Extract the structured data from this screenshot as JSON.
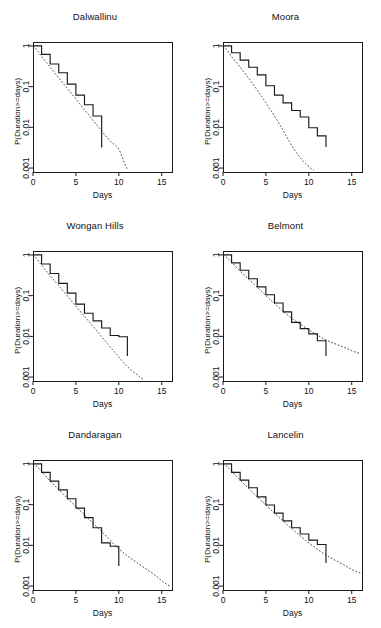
{
  "figure": {
    "layout": {
      "rows": 3,
      "cols": 2
    },
    "common_xlabel": "Days",
    "common_ylabel": "P(Duration>=days)",
    "x_ticks": [
      0,
      5,
      10,
      15
    ],
    "x_tick_labels": [
      "0",
      "5",
      "10",
      "15"
    ],
    "y_ticks": [
      1,
      0.1,
      0.01,
      0.001
    ],
    "y_tick_labels": [
      "1",
      "0.1",
      "0.01",
      "0.001"
    ],
    "y_scale": "log",
    "xlim": [
      0,
      16.2
    ],
    "ylim": [
      0.0008,
      1.25
    ],
    "line_color": "#1a1a1a",
    "fit_style": "dashed",
    "step_style": "solid"
  },
  "chart_data": [
    {
      "type": "line",
      "title": "Dalwallinu",
      "xlabel": "Days",
      "ylabel": "P(Duration>=days)",
      "yscale": "log",
      "xlim": [
        0,
        16.2
      ],
      "ylim": [
        0.0008,
        1.25
      ],
      "xticks": [
        0,
        5,
        10,
        15
      ],
      "yticks": [
        1,
        0.1,
        0.01,
        0.001
      ],
      "grid": false,
      "legend": "none",
      "series": [
        {
          "name": "empirical step",
          "style": "solid-step",
          "x": [
            0,
            1,
            2,
            3,
            4,
            5,
            6,
            7,
            8,
            8
          ],
          "y": [
            1.0,
            0.62,
            0.36,
            0.22,
            0.115,
            0.062,
            0.036,
            0.019,
            0.0105,
            0.0032
          ]
        },
        {
          "name": "fitted",
          "style": "dashed",
          "x": [
            0,
            1,
            2,
            3,
            4,
            5,
            6,
            7,
            8,
            9,
            10,
            11
          ],
          "y": [
            1.0,
            0.55,
            0.3,
            0.165,
            0.09,
            0.05,
            0.027,
            0.015,
            0.0082,
            0.0046,
            0.0029,
            0.00095
          ]
        }
      ]
    },
    {
      "type": "line",
      "title": "Moora",
      "xlabel": "Days",
      "ylabel": "P(Duration>=days)",
      "yscale": "log",
      "xlim": [
        0,
        16.2
      ],
      "ylim": [
        0.0008,
        1.25
      ],
      "xticks": [
        0,
        5,
        10,
        15
      ],
      "yticks": [
        1,
        0.1,
        0.01,
        0.001
      ],
      "grid": false,
      "legend": "none",
      "series": [
        {
          "name": "empirical step",
          "style": "solid-step",
          "x": [
            0,
            1,
            2,
            3,
            4,
            5,
            6,
            7,
            8,
            9,
            10,
            11,
            12,
            12
          ],
          "y": [
            1.0,
            0.68,
            0.45,
            0.3,
            0.195,
            0.105,
            0.062,
            0.04,
            0.026,
            0.018,
            0.0098,
            0.0062,
            0.0062,
            0.0033
          ]
        },
        {
          "name": "fitted",
          "style": "dashed",
          "x": [
            0,
            1,
            2,
            3,
            4,
            5,
            6,
            7,
            8,
            9,
            10,
            10.6
          ],
          "y": [
            1.0,
            0.55,
            0.3,
            0.16,
            0.082,
            0.04,
            0.019,
            0.0085,
            0.0036,
            0.0018,
            0.0011,
            0.0009
          ]
        }
      ]
    },
    {
      "type": "line",
      "title": "Wongan Hills",
      "xlabel": "Days",
      "ylabel": "P(Duration>=days)",
      "yscale": "log",
      "xlim": [
        0,
        16.2
      ],
      "ylim": [
        0.0008,
        1.25
      ],
      "xticks": [
        0,
        5,
        10,
        15
      ],
      "yticks": [
        1,
        0.1,
        0.01,
        0.001
      ],
      "grid": false,
      "legend": "none",
      "series": [
        {
          "name": "empirical step",
          "style": "solid-step",
          "x": [
            0,
            1,
            2,
            3,
            4,
            5,
            6,
            7,
            8,
            9,
            10,
            11,
            11
          ],
          "y": [
            1.0,
            0.6,
            0.35,
            0.2,
            0.115,
            0.062,
            0.037,
            0.024,
            0.016,
            0.0105,
            0.0098,
            0.0098,
            0.0033
          ]
        },
        {
          "name": "fitted",
          "style": "dashed",
          "x": [
            0,
            1,
            2,
            3,
            4,
            5,
            6,
            7,
            8,
            9,
            10,
            11,
            12,
            13
          ],
          "y": [
            1.0,
            0.56,
            0.31,
            0.175,
            0.098,
            0.055,
            0.031,
            0.0175,
            0.0098,
            0.0055,
            0.0031,
            0.0018,
            0.0012,
            0.00085
          ]
        }
      ]
    },
    {
      "type": "line",
      "title": "Belmont",
      "xlabel": "Days",
      "ylabel": "P(Duration>=days)",
      "yscale": "log",
      "xlim": [
        0,
        16.2
      ],
      "ylim": [
        0.0008,
        1.25
      ],
      "xticks": [
        0,
        5,
        10,
        15
      ],
      "yticks": [
        1,
        0.1,
        0.01,
        0.001
      ],
      "grid": false,
      "legend": "none",
      "series": [
        {
          "name": "empirical step",
          "style": "solid-step",
          "x": [
            0,
            1,
            2,
            3,
            4,
            5,
            6,
            7,
            8,
            9,
            10,
            11,
            12,
            12
          ],
          "y": [
            1.0,
            0.64,
            0.42,
            0.26,
            0.165,
            0.105,
            0.066,
            0.04,
            0.022,
            0.0155,
            0.0115,
            0.0078,
            0.0078,
            0.0033
          ]
        },
        {
          "name": "fitted",
          "style": "dashed",
          "x": [
            0,
            2,
            4,
            6,
            8,
            10,
            12,
            14,
            16
          ],
          "y": [
            1.0,
            0.4,
            0.16,
            0.064,
            0.028,
            0.0145,
            0.0082,
            0.0055,
            0.0038
          ]
        }
      ]
    },
    {
      "type": "line",
      "title": "Dandaragan",
      "xlabel": "Days",
      "ylabel": "P(Duration>=days)",
      "yscale": "log",
      "xlim": [
        0,
        16.2
      ],
      "ylim": [
        0.0008,
        1.25
      ],
      "xticks": [
        0,
        5,
        10,
        15
      ],
      "yticks": [
        1,
        0.1,
        0.01,
        0.001
      ],
      "grid": false,
      "legend": "none",
      "series": [
        {
          "name": "empirical step",
          "style": "solid-step",
          "x": [
            0,
            1,
            2,
            3,
            4,
            5,
            6,
            7,
            8,
            9,
            10,
            10
          ],
          "y": [
            1.0,
            0.62,
            0.38,
            0.23,
            0.14,
            0.082,
            0.048,
            0.027,
            0.0115,
            0.0095,
            0.0062,
            0.0031
          ]
        },
        {
          "name": "fitted",
          "style": "dashed",
          "x": [
            0,
            2,
            4,
            6,
            8,
            10,
            12,
            14,
            16
          ],
          "y": [
            1.0,
            0.38,
            0.145,
            0.056,
            0.022,
            0.0082,
            0.0039,
            0.002,
            0.001
          ]
        }
      ]
    },
    {
      "type": "line",
      "title": "Lancelin",
      "xlabel": "Days",
      "ylabel": "P(Duration>=days)",
      "yscale": "log",
      "xlim": [
        0,
        16.2
      ],
      "ylim": [
        0.0008,
        1.25
      ],
      "xticks": [
        0,
        5,
        10,
        15
      ],
      "yticks": [
        1,
        0.1,
        0.01,
        0.001
      ],
      "grid": false,
      "legend": "none",
      "series": [
        {
          "name": "empirical step",
          "style": "solid-step",
          "x": [
            0,
            1,
            2,
            3,
            4,
            5,
            6,
            7,
            8,
            9,
            10,
            11,
            12,
            12
          ],
          "y": [
            1.0,
            0.62,
            0.4,
            0.26,
            0.155,
            0.098,
            0.062,
            0.04,
            0.027,
            0.019,
            0.0135,
            0.0105,
            0.0105,
            0.0037
          ]
        },
        {
          "name": "fitted",
          "style": "dashed",
          "x": [
            0,
            2,
            4,
            6,
            8,
            10,
            12,
            14,
            16
          ],
          "y": [
            1.0,
            0.4,
            0.155,
            0.062,
            0.026,
            0.0115,
            0.0058,
            0.0034,
            0.0021
          ]
        }
      ]
    }
  ]
}
